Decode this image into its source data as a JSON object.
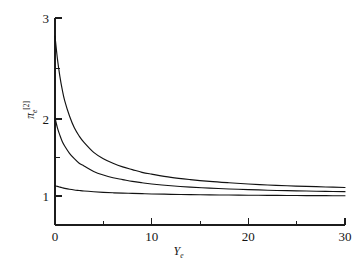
{
  "figure": {
    "background_color": "#ffffff",
    "line_color": "#121212",
    "axis_color": "#1c1c1c"
  },
  "axes": {
    "x_label_main": "Y",
    "x_label_sub": "e",
    "y_label_main": "π",
    "y_label_sub": "e",
    "y_label_sup": "[2]",
    "x_ticks": [
      "0",
      "10",
      "20",
      "30"
    ],
    "y_ticks": [
      "1",
      "2",
      "3"
    ]
  },
  "chart_data": {
    "type": "line",
    "title": "",
    "xlabel": "Y_e",
    "ylabel": "pi_e^[2]",
    "xlim": [
      0,
      30
    ],
    "ylim": [
      0.72,
      3.0
    ],
    "grid": false,
    "legend": "none",
    "x_ticks_major": [
      0,
      10,
      20,
      30
    ],
    "x_ticks_minor": [
      5,
      15,
      25
    ],
    "y_ticks_major": [
      1,
      2,
      3
    ],
    "y_ticks_minor": [
      1.5,
      2.5
    ],
    "x": [
      0,
      0.25,
      0.5,
      0.75,
      1,
      1.5,
      2,
      2.5,
      3,
      4,
      5,
      6,
      7,
      8,
      9,
      10,
      12,
      14,
      16,
      18,
      20,
      22,
      24,
      26,
      28,
      30
    ],
    "series": [
      {
        "name": "upper-curve",
        "values": [
          2.8,
          2.55,
          2.36,
          2.21,
          2.09,
          1.92,
          1.79,
          1.7,
          1.63,
          1.52,
          1.45,
          1.4,
          1.36,
          1.33,
          1.3,
          1.28,
          1.245,
          1.22,
          1.2,
          1.185,
          1.172,
          1.161,
          1.152,
          1.145,
          1.139,
          1.133
        ]
      },
      {
        "name": "middle-curve",
        "values": [
          1.9,
          1.79,
          1.71,
          1.64,
          1.59,
          1.51,
          1.45,
          1.4,
          1.37,
          1.31,
          1.27,
          1.24,
          1.22,
          1.2,
          1.185,
          1.172,
          1.152,
          1.137,
          1.126,
          1.117,
          1.11,
          1.103,
          1.098,
          1.094,
          1.09,
          1.087
        ]
      },
      {
        "name": "lower-curve",
        "values": [
          1.155,
          1.145,
          1.137,
          1.13,
          1.124,
          1.114,
          1.106,
          1.1,
          1.094,
          1.086,
          1.08,
          1.075,
          1.071,
          1.068,
          1.065,
          1.062,
          1.058,
          1.055,
          1.052,
          1.05,
          1.048,
          1.047,
          1.045,
          1.044,
          1.043,
          1.042
        ]
      }
    ]
  }
}
